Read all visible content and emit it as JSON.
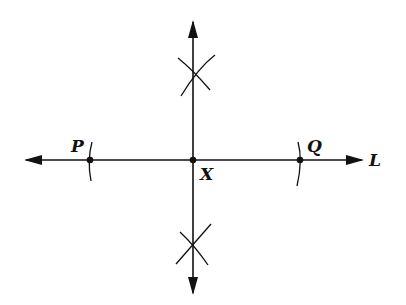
{
  "diagram": {
    "type": "geometric-construction",
    "colors": {
      "stroke": "#111111",
      "background": "#ffffff"
    },
    "line_L": {
      "label": "L",
      "y": 160,
      "x_start": 26,
      "x_end": 362
    },
    "perpendicular": {
      "x": 193,
      "y_start": 20,
      "y_end": 295
    },
    "points": [
      {
        "id": "P",
        "label": "P",
        "x": 90,
        "y": 160
      },
      {
        "id": "X",
        "label": "X",
        "x": 193,
        "y": 160
      },
      {
        "id": "Q",
        "label": "Q",
        "x": 300,
        "y": 160
      }
    ],
    "arcs": [
      {
        "name": "arc-at-P",
        "cx": 193,
        "cy": 160,
        "r": 103,
        "side": "left"
      },
      {
        "name": "arc-at-Q",
        "cx": 193,
        "cy": 160,
        "r": 107,
        "side": "right"
      }
    ],
    "intersection_marks": [
      {
        "name": "upper-arc-intersection",
        "x": 193,
        "y": 72
      },
      {
        "name": "lower-arc-intersection",
        "x": 193,
        "y": 248
      }
    ]
  }
}
